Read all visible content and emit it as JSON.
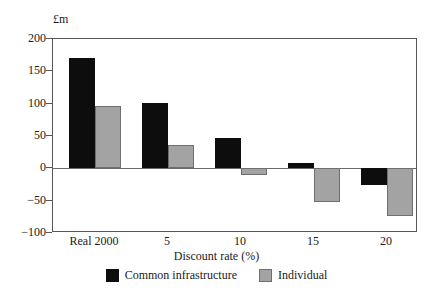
{
  "chart_data": {
    "type": "bar",
    "title": "",
    "subtitle": "",
    "unit_label": "£m",
    "xlabel": "Discount rate (%)",
    "ylabel": "",
    "categories": [
      "Real 2000",
      "5",
      "10",
      "15",
      "20"
    ],
    "series": [
      {
        "name": "Common infrastructure",
        "color": "#0d0d0d",
        "values": [
          170,
          101,
          47,
          8,
          -26
        ]
      },
      {
        "name": "Individual",
        "color": "#a3a3a3",
        "values": [
          96,
          36,
          -11,
          -52,
          -74
        ]
      }
    ],
    "ylim": [
      -100,
      200
    ],
    "ytick_values": [
      200,
      150,
      100,
      50,
      0,
      -50,
      -100
    ],
    "ytick_labels": [
      "200",
      "150",
      "100",
      "50",
      "0",
      "−50",
      "−100"
    ],
    "grid": false,
    "zero_line": true,
    "legend_position": "bottom"
  }
}
